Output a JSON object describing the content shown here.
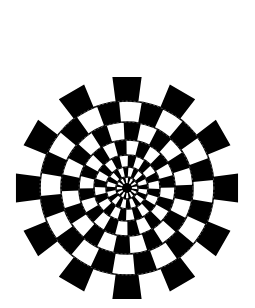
{
  "figure": {
    "title": "Radial checkered illusion",
    "background": "#ffffff",
    "foreground": "#000000",
    "center": [
      127,
      188
    ],
    "outer_radius": 112,
    "sectors": 24,
    "ring_radii": [
      87,
      66,
      48,
      33,
      21,
      11
    ],
    "ring_color": "#ffffff",
    "ring_width": 1.6
  }
}
